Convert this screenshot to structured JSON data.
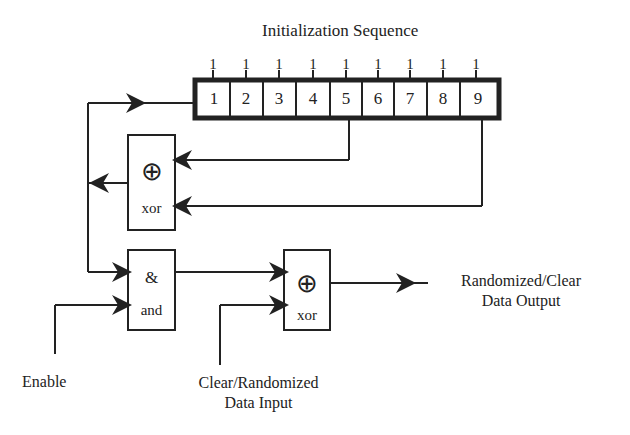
{
  "diagram": {
    "title": "Initialization Sequence",
    "init_bits": [
      "1",
      "1",
      "1",
      "1",
      "1",
      "1",
      "1",
      "1",
      "1"
    ],
    "register_cells": [
      "1",
      "2",
      "3",
      "4",
      "5",
      "6",
      "7",
      "8",
      "9"
    ],
    "feedback_gate": {
      "symbol": "⊕",
      "name": "xor"
    },
    "and_gate": {
      "symbol": "&",
      "name": "and"
    },
    "output_gate": {
      "symbol": "⊕",
      "name": "xor"
    },
    "labels": {
      "enable": "Enable",
      "input_line1": "Clear/Randomized",
      "input_line2": "Data Input",
      "output_line1": "Randomized/Clear",
      "output_line2": "Data Output"
    }
  }
}
